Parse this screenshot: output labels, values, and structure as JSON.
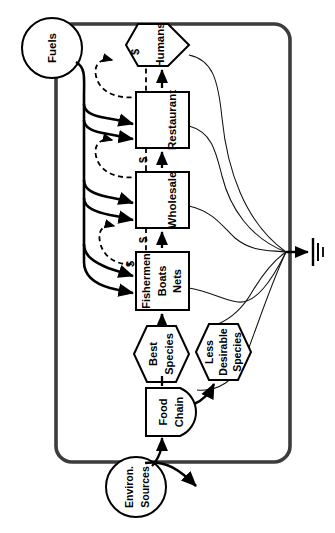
{
  "diagram": {
    "orientation_note": "labels rotated 90 degrees",
    "system_boundary": {
      "name": "system-boundary",
      "shape": "rounded-rectangle"
    },
    "outside_sources": [
      {
        "id": "fuels",
        "label": "Fuels",
        "shape": "circle"
      },
      {
        "id": "environ",
        "label_line1": "Environ.",
        "label_line2": "Sources",
        "shape": "circle"
      }
    ],
    "nodes": [
      {
        "id": "humans",
        "label": "Humans",
        "shape": "hexagon"
      },
      {
        "id": "restaurant",
        "label": "Restaurant",
        "shape": "box"
      },
      {
        "id": "wholesale",
        "label": "Wholesale",
        "shape": "box"
      },
      {
        "id": "fishermen",
        "label_line1": "Fishermen",
        "label_line2": "Boats",
        "label_line3": "Nets",
        "shape": "box"
      },
      {
        "id": "best-species",
        "label_line1": "Best",
        "label_line2": "Species",
        "shape": "hexagon"
      },
      {
        "id": "less-desirable",
        "label_line1": "Less",
        "label_line2": "Desirable",
        "label_line3": "Species",
        "shape": "hexagon"
      },
      {
        "id": "food-chain",
        "label_line1": "Food",
        "label_line2": "Chain",
        "shape": "tank"
      },
      {
        "id": "heat-sink",
        "label": "",
        "shape": "heat-sink"
      }
    ],
    "money_labels": [
      {
        "id": "dollar-humans",
        "text": "$"
      },
      {
        "id": "dollar-restaurant",
        "text": "$"
      },
      {
        "id": "dollar-wholesale",
        "text": "$"
      },
      {
        "id": "dollar-fishermen",
        "text": "$"
      }
    ],
    "colors": {
      "ink": "#000000",
      "boundary": "#3a3a3a",
      "paper": "#ffffff",
      "thin_line": "#1a1a1a"
    }
  }
}
